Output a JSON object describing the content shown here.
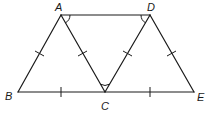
{
  "diagram": {
    "type": "geometry",
    "points": {
      "A": {
        "label": "A",
        "x": 61,
        "y": 15
      },
      "D": {
        "label": "D",
        "x": 150,
        "y": 15
      },
      "B": {
        "label": "B",
        "x": 18,
        "y": 92
      },
      "C": {
        "label": "C",
        "x": 105,
        "y": 92
      },
      "E": {
        "label": "E",
        "x": 194,
        "y": 92
      }
    },
    "segments": [
      "AD",
      "AB",
      "AC",
      "DC",
      "DE",
      "BE"
    ],
    "congruence_ticks": [
      "AB",
      "AC",
      "DC",
      "DE",
      "BC",
      "CE"
    ],
    "angle_marks": [
      "DAC",
      "ADC",
      "ACD"
    ],
    "stroke_color": "#1a1a1a"
  }
}
